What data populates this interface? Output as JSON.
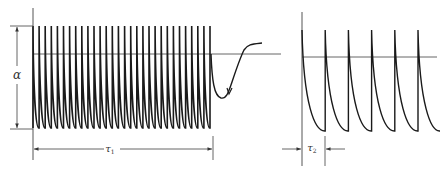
{
  "figure": {
    "left_panel": {
      "amplitude_label": "α",
      "duration_label": "τ",
      "duration_subscript": "1",
      "spike_count": 30,
      "description": "train of spikes followed by recovery dip"
    },
    "right_panel": {
      "interval_label": "τ",
      "interval_subscript": "2",
      "spike_count": 6
    },
    "colors": {
      "trace": "#1a1a1a",
      "axis": "#555555",
      "background": "#ffffff"
    }
  }
}
